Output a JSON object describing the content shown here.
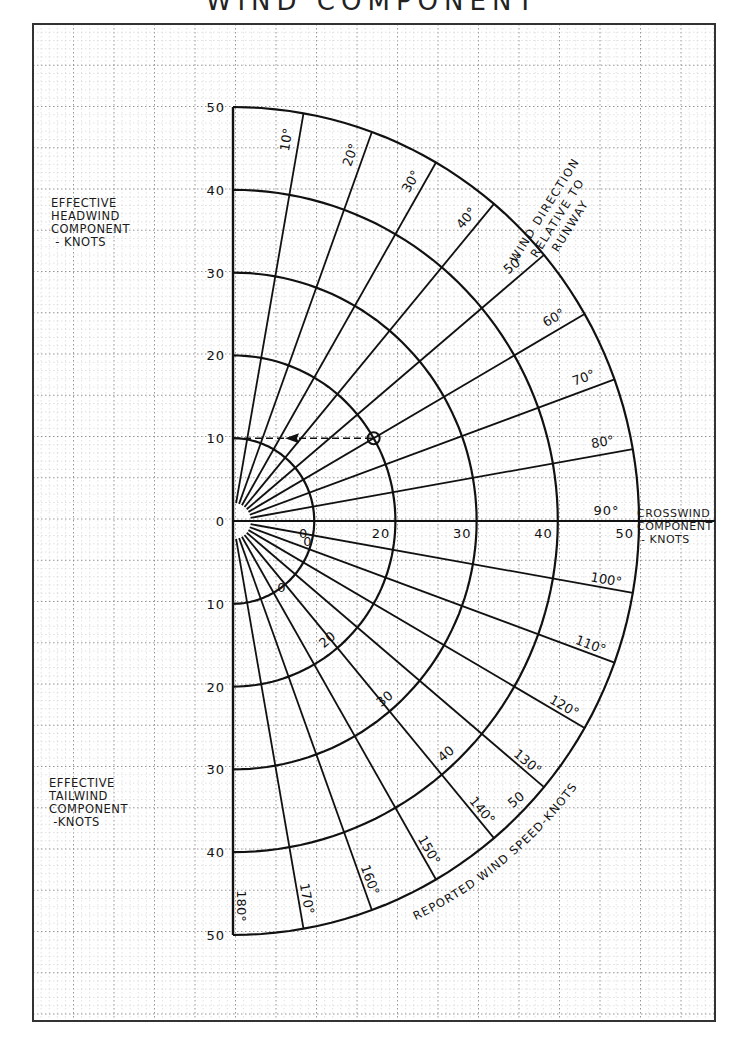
{
  "title": "WIND COMPONENT",
  "labels": {
    "headwind": [
      "EFFECTIVE",
      "HEADWIND",
      "COMPONENT",
      " - KNOTS"
    ],
    "tailwind": [
      "EFFECTIVE",
      "TAILWIND",
      "COMPONENT",
      " -KNOTS"
    ],
    "crosswind": [
      "CROSSWIND",
      "COMPONENT",
      " - KNOTS"
    ],
    "wind_direction": [
      "WIND DIRECTION",
      "RELATIVE TO",
      "RUNWAY"
    ],
    "reported_speed": "REPORTED WIND SPEED-KNOTS"
  },
  "chart_data": {
    "type": "polar-nomogram",
    "title": "WIND COMPONENT",
    "headwind_axis": {
      "label": "EFFECTIVE HEADWIND COMPONENT - KNOTS",
      "ticks": [
        0,
        10,
        20,
        30,
        40,
        50
      ]
    },
    "tailwind_axis": {
      "label": "EFFECTIVE TAILWIND COMPONENT - KNOTS",
      "ticks": [
        10,
        20,
        30,
        40,
        50
      ]
    },
    "crosswind_axis": {
      "label": "CROSSWIND COMPONENT - KNOTS",
      "ticks": [
        10,
        20,
        30,
        40,
        50
      ]
    },
    "speed_circles": {
      "label": "REPORTED WIND SPEED-KNOTS",
      "values": [
        10,
        20,
        30,
        40,
        50
      ]
    },
    "direction_lines": {
      "label": "WIND DIRECTION RELATIVE TO RUNWAY",
      "values": [
        0,
        10,
        20,
        30,
        40,
        50,
        60,
        70,
        80,
        90,
        100,
        110,
        120,
        130,
        140,
        150,
        160,
        170,
        180
      ],
      "tick_labels": [
        "10°",
        "20°",
        "30°",
        "40°",
        "50°",
        "60°",
        "70°",
        "80°",
        "90°",
        "100°",
        "110°",
        "120°",
        "130°",
        "140°",
        "150°",
        "160°",
        "170°",
        "180°"
      ]
    },
    "example": {
      "wind_speed": 20,
      "direction_deg": 60,
      "headwind_component": 10,
      "crosswind_component": 17.3
    },
    "grid": true
  }
}
